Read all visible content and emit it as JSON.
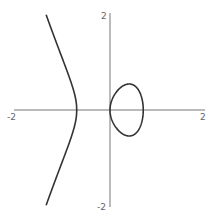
{
  "chart_data": {
    "type": "line",
    "title": "",
    "xlabel": "",
    "ylabel": "",
    "xlim": [
      -2,
      2
    ],
    "ylim": [
      -2,
      2
    ],
    "grid": false,
    "legend": null,
    "x_tick_labels": [
      "-2",
      "2"
    ],
    "y_tick_labels": [
      "2",
      "-2"
    ],
    "series": [
      {
        "name": "curve",
        "description": "cubic curve y^2 = a*x*(r^2 - x^2), with unbounded left branch and closed oval between x=0 and x=r",
        "params": {
          "a": 2.27,
          "r": 0.7
        },
        "color": "#333333"
      }
    ]
  },
  "axes": {
    "x_min_label": "-2",
    "x_max_label": "2",
    "y_max_label": "2",
    "y_min_label": "-2",
    "axis_color": "#777777"
  }
}
